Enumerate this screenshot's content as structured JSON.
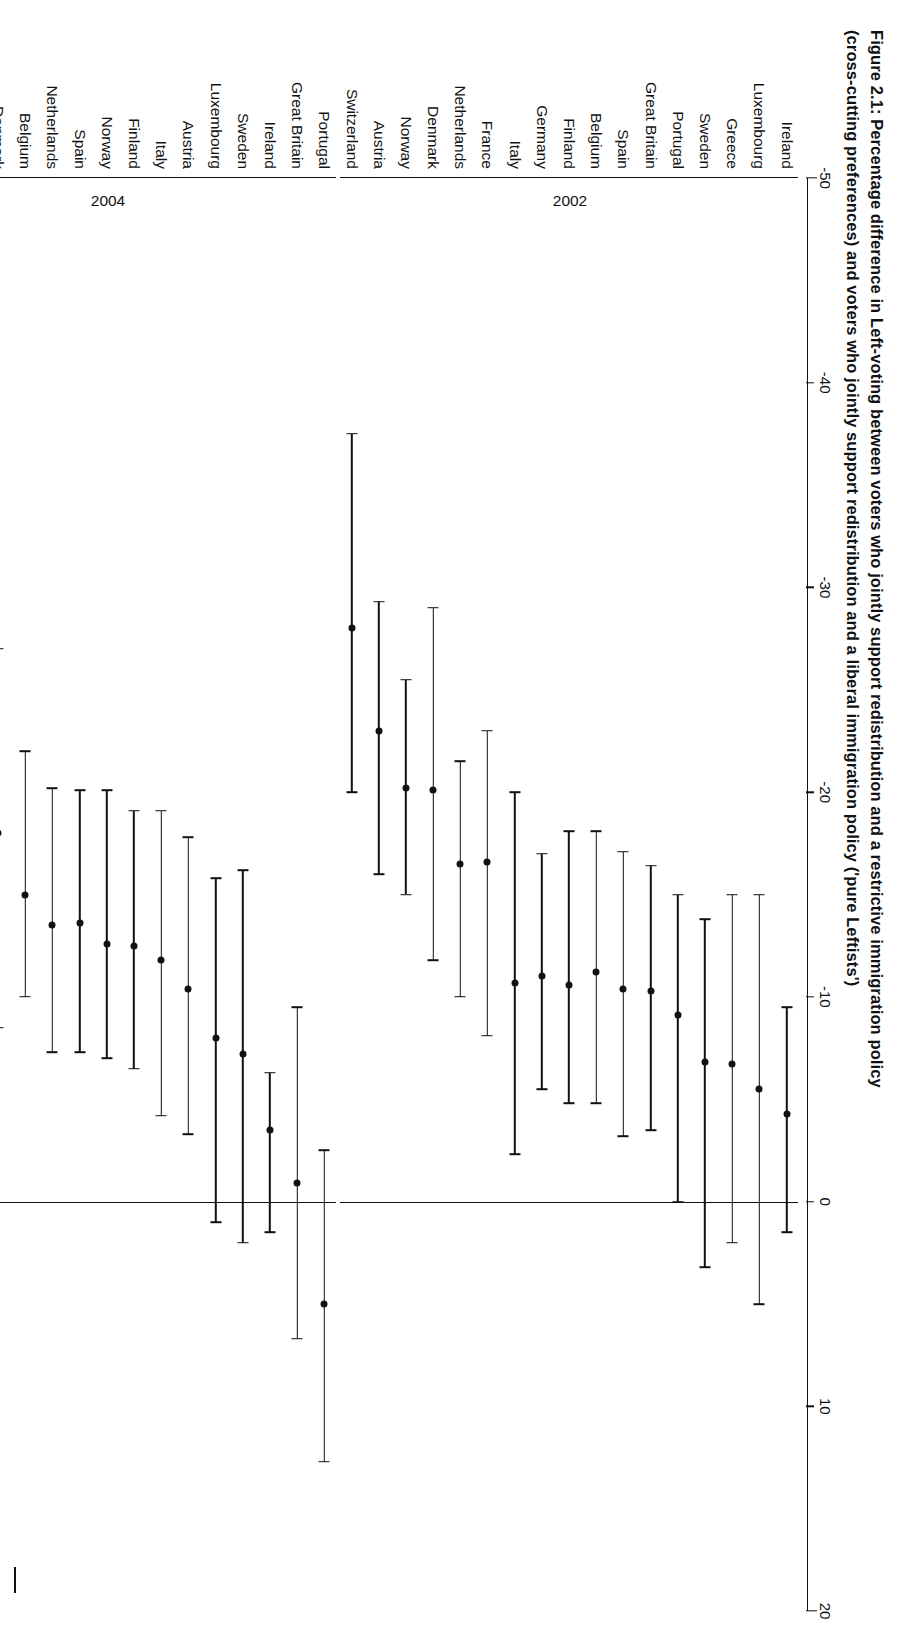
{
  "figure": {
    "caption_line1": "Figure 2.1: Percentage difference in Left-voting between voters who jointly support redistribution and a restrictive immigration policy",
    "caption_line2": "(cross-cutting preferences) and voters who jointly support redistribution and a liberal immigration policy ('pure Leftists')"
  },
  "chart_data": {
    "type": "scatter",
    "xlabel": "",
    "ylabel": "",
    "xlim": [
      -50,
      20
    ],
    "ticks": [
      -50,
      -40,
      -30,
      -20,
      -10,
      0,
      10,
      20
    ],
    "tick_labels": [
      "-50",
      "-40",
      "-30",
      "-20",
      "-10",
      "0",
      "10",
      "20"
    ],
    "grid": false,
    "legend": "none",
    "zero_reference_line": 0,
    "orientation": "horizontal-error-bars",
    "marker": "filled-circle",
    "groups": [
      {
        "label": "2002",
        "rows": [
          {
            "country": "Ireland",
            "value": -4.3,
            "low": -9.5,
            "high": 1.5
          },
          {
            "country": "Luxembourg",
            "value": -5.5,
            "low": -15.0,
            "high": 5.0
          },
          {
            "country": "Greece",
            "value": -6.7,
            "low": -15.0,
            "high": 2.0
          },
          {
            "country": "Sweden",
            "value": -6.8,
            "low": -13.8,
            "high": 3.2
          },
          {
            "country": "Portugal",
            "value": -9.1,
            "low": -15.0,
            "high": 0.0
          },
          {
            "country": "Great Britain",
            "value": -10.3,
            "low": -16.4,
            "high": -3.5
          },
          {
            "country": "Spain",
            "value": -10.4,
            "low": -17.1,
            "high": -3.2
          },
          {
            "country": "Belgium",
            "value": -11.2,
            "low": -18.1,
            "high": -4.8
          },
          {
            "country": "Finland",
            "value": -10.6,
            "low": -18.1,
            "high": -4.8
          },
          {
            "country": "Germany",
            "value": -11.0,
            "low": -17.0,
            "high": -5.5
          },
          {
            "country": "Italy",
            "value": -10.7,
            "low": -20.0,
            "high": -2.3
          },
          {
            "country": "France",
            "value": -16.6,
            "low": -23.0,
            "high": -8.1
          },
          {
            "country": "Netherlands",
            "value": -16.5,
            "low": -21.5,
            "high": -10.0
          },
          {
            "country": "Denmark",
            "value": -20.1,
            "low": -29.0,
            "high": -11.8
          },
          {
            "country": "Norway",
            "value": -20.2,
            "low": -25.5,
            "high": -15.0
          },
          {
            "country": "Austria",
            "value": -23.0,
            "low": -29.3,
            "high": -16.0
          },
          {
            "country": "Switzerland",
            "value": -28.0,
            "low": -37.5,
            "high": -20.0
          }
        ]
      },
      {
        "label": "2004",
        "rows": [
          {
            "country": "Portugal",
            "value": 5.0,
            "low": -2.5,
            "high": 12.7
          },
          {
            "country": "Great Britain",
            "value": -0.9,
            "low": -9.5,
            "high": 6.7
          },
          {
            "country": "Ireland",
            "value": -3.5,
            "low": -6.3,
            "high": 1.5
          },
          {
            "country": "Sweden",
            "value": -7.2,
            "low": -16.2,
            "high": 2.0
          },
          {
            "country": "Luxembourg",
            "value": -8.0,
            "low": -15.8,
            "high": 1.0
          },
          {
            "country": "Austria",
            "value": -10.4,
            "low": -17.8,
            "high": -3.3
          },
          {
            "country": "Italy",
            "value": -11.8,
            "low": -19.1,
            "high": -4.2
          },
          {
            "country": "Finland",
            "value": -12.5,
            "low": -19.1,
            "high": -6.5
          },
          {
            "country": "Norway",
            "value": -12.6,
            "low": -20.1,
            "high": -7.0
          },
          {
            "country": "Spain",
            "value": -13.6,
            "low": -20.1,
            "high": -7.3
          },
          {
            "country": "Netherlands",
            "value": -13.5,
            "low": -20.2,
            "high": -7.3
          },
          {
            "country": "Belgium",
            "value": -15.0,
            "low": -22.0,
            "high": -10.0
          },
          {
            "country": "Denmark",
            "value": -18.0,
            "low": -27.0,
            "high": -8.5
          },
          {
            "country": "Germany",
            "value": -18.2,
            "low": -23.6,
            "high": -11.5
          },
          {
            "country": "Greece",
            "value": -20.0,
            "low": -28.0,
            "high": -13.0
          },
          {
            "country": "France",
            "value": -26.6,
            "low": -33.0,
            "high": -21.0
          },
          {
            "country": "Switzerland",
            "value": -31.6,
            "low": -40.0,
            "high": -24.5
          }
        ]
      },
      {
        "label": "2006",
        "rows": [
          {
            "country": "Great Britain",
            "value": -0.3,
            "low": -7.0,
            "high": 6.6
          },
          {
            "country": "Portugal",
            "value": -1.8,
            "low": -8.0,
            "high": 4.9
          },
          {
            "country": "Ireland",
            "value": -4.1,
            "low": -10.0,
            "high": 2.0
          },
          {
            "country": "Sweden",
            "value": -4.3,
            "low": -12.5,
            "high": 6.0
          },
          {
            "country": "Germany",
            "value": -6.8,
            "low": -12.3,
            "high": -3.0
          },
          {
            "country": "Belgium",
            "value": -11.2,
            "low": -17.6,
            "high": -6.0
          },
          {
            "country": "Finland",
            "value": -11.3,
            "low": -17.7,
            "high": -5.3
          },
          {
            "country": "Norway",
            "value": -11.4,
            "low": -18.5,
            "high": -5.0
          },
          {
            "country": "Austria",
            "value": -12.4,
            "low": -19.4,
            "high": -6.8
          },
          {
            "country": "Netherlands",
            "value": -12.3,
            "low": -19.5,
            "high": -6.8
          },
          {
            "country": "Spain",
            "value": -20.6,
            "low": -27.8,
            "high": -14.6
          },
          {
            "country": "Denmark",
            "value": -23.0,
            "low": -30.3,
            "high": -13.8
          },
          {
            "country": "France",
            "value": -23.9,
            "low": -29.9,
            "high": -16.9
          },
          {
            "country": "Switzerland",
            "value": -35.5,
            "low": -44.8,
            "high": -27.5
          }
        ]
      }
    ]
  }
}
